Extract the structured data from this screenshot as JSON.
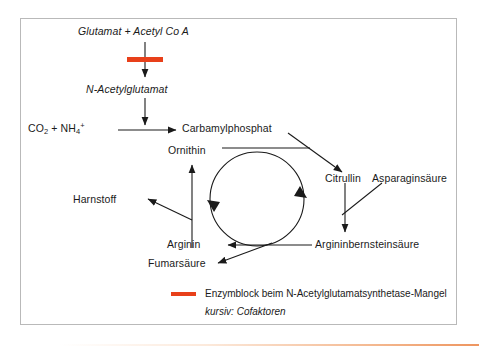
{
  "diagram": {
    "colors": {
      "enzyme_block": "#e8401a",
      "line": "#1a1a1a",
      "frame": "#b9b9b9"
    },
    "nodes": {
      "glutamat_acetyl": "Glutamat + Acetyl Co A",
      "n_acetylglutamat": "N-Acetylglutamat",
      "co2_nh4_main": "CO",
      "co2_sub": "2",
      "co2_plus": " + NH",
      "nh4_sub": "4",
      "nh4_sup": "+",
      "carbamylphosphat": "Carbamylphosphat",
      "ornithin": "Ornithin",
      "citrullin": "Citrullin",
      "asparaginsaeure": "Asparaginsäure",
      "harnstoff": "Harnstoff",
      "arginin": "Arginin",
      "argininbernsteinsaeure": "Argininbernsteinsäure",
      "fumarsaeure": "Fumarsäure"
    },
    "legend": {
      "enzyme_block_label": "Enzymblock beim N-Acetylglutamatsynthetase-Mangel",
      "cofactor_note": "kursiv: Cofaktoren"
    }
  }
}
